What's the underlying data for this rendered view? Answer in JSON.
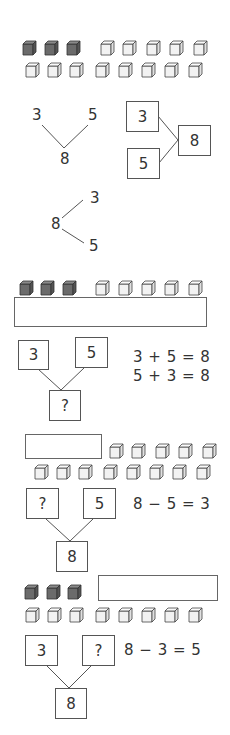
{
  "colors": {
    "dark_cube": "#6b6b6b",
    "light_cube": "#f0f0f0",
    "line": "#555555",
    "text": "#333333"
  },
  "section1": {
    "cube_rows": [
      {
        "dark": 3,
        "light": 5
      },
      {
        "dark": 0,
        "light": 8
      }
    ]
  },
  "section2": {
    "v_tree": {
      "left": "3",
      "right": "5",
      "bottom": "8"
    },
    "box_tree": {
      "top": "3",
      "bottom": "5",
      "result": "8"
    }
  },
  "section3": {
    "branch": {
      "root": "8",
      "top": "3",
      "bottom": "5"
    }
  },
  "section4": {
    "cubes": {
      "dark": 3,
      "light": 5
    },
    "box_tree": {
      "left": "3",
      "right": "5",
      "bottom": "?"
    },
    "equations": [
      "3 + 5 = 8",
      "5 + 3 = 8"
    ]
  },
  "section5": {
    "cubes_row1_light": 5,
    "cubes_row2_light": 8,
    "box_tree": {
      "left": "?",
      "right": "5",
      "bottom": "8"
    },
    "equation": "8 − 5 = 3"
  },
  "section6": {
    "cubes_row1_dark": 3,
    "cubes_row2_light": 8,
    "box_tree": {
      "left": "3",
      "right": "?",
      "bottom": "8"
    },
    "equation": "8 − 3 = 5"
  }
}
